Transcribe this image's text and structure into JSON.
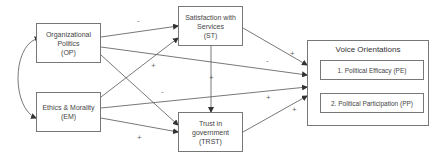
{
  "nodes": {
    "op": {
      "lines": [
        "Organizational",
        "Politics",
        "(OP)"
      ]
    },
    "em": {
      "lines": [
        "Ethics & Morality",
        "(EM)"
      ]
    },
    "st": {
      "lines": [
        "Satisfaction with",
        "Services",
        "(ST)"
      ]
    },
    "trst": {
      "lines": [
        "Trust in",
        "government",
        "(TRST)"
      ]
    },
    "voice": {
      "title": "Voice Orientations",
      "items": [
        "1. Political Efficacy (PE)",
        "2. Political Participation (PP)"
      ]
    }
  },
  "edges": [
    {
      "from": "OP",
      "to": "ST",
      "sign": "-"
    },
    {
      "from": "OP",
      "to": "Voice Orientations",
      "sign": "-"
    },
    {
      "from": "OP",
      "to": "TRST",
      "sign": "-"
    },
    {
      "from": "EM",
      "to": "ST",
      "sign": "+"
    },
    {
      "from": "EM",
      "to": "Voice Orientations",
      "sign": "+"
    },
    {
      "from": "EM",
      "to": "TRST",
      "sign": "+"
    },
    {
      "from": "ST",
      "to": "TRST",
      "sign": "+"
    },
    {
      "from": "ST",
      "to": "Voice Orientations",
      "sign": "+"
    },
    {
      "from": "TRST",
      "to": "Voice Orientations",
      "sign": "+"
    },
    {
      "from": "OP",
      "to": "EM",
      "sign": "",
      "type": "correlation"
    }
  ],
  "signs": {
    "op_st": "-",
    "em_st": "+",
    "op_trst": "-",
    "em_trst": "+",
    "st_trst": "+",
    "st_voice": "+",
    "op_voice": "-",
    "em_voice": "+",
    "trst_voice": "+"
  }
}
